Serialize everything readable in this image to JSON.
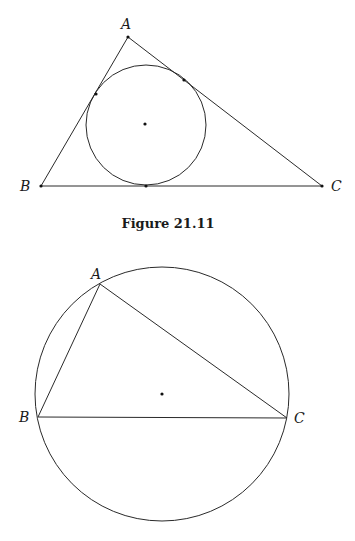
{
  "figure1": {
    "caption": "Figure 21.11",
    "title": "Triangle with inscribed circle",
    "vertices": {
      "A": {
        "label": "A",
        "x": 128,
        "y": 37
      },
      "B": {
        "label": "B",
        "x": 41,
        "y": 186
      },
      "C": {
        "label": "C",
        "x": 322,
        "y": 186
      }
    },
    "incircle": {
      "cx": 146,
      "cy": 125,
      "r": 60
    },
    "incenter": {
      "x": 145,
      "y": 124
    },
    "tangent_points": [
      {
        "x": 96,
        "y": 94
      },
      {
        "x": 184,
        "y": 80
      },
      {
        "x": 146,
        "y": 186
      }
    ]
  },
  "figure2": {
    "title": "Triangle with circumscribed circle",
    "vertices": {
      "A": {
        "label": "A",
        "x": 100,
        "y": 284
      },
      "B": {
        "label": "B",
        "x": 38,
        "y": 417
      },
      "C": {
        "label": "C",
        "x": 287,
        "y": 418
      }
    },
    "circumcircle": {
      "cx": 162,
      "cy": 394,
      "r": 127
    },
    "circumcenter": {
      "x": 162,
      "y": 394
    }
  },
  "colors": {
    "stroke": "#2a2a2a",
    "point": "#111111",
    "background": "#ffffff"
  }
}
